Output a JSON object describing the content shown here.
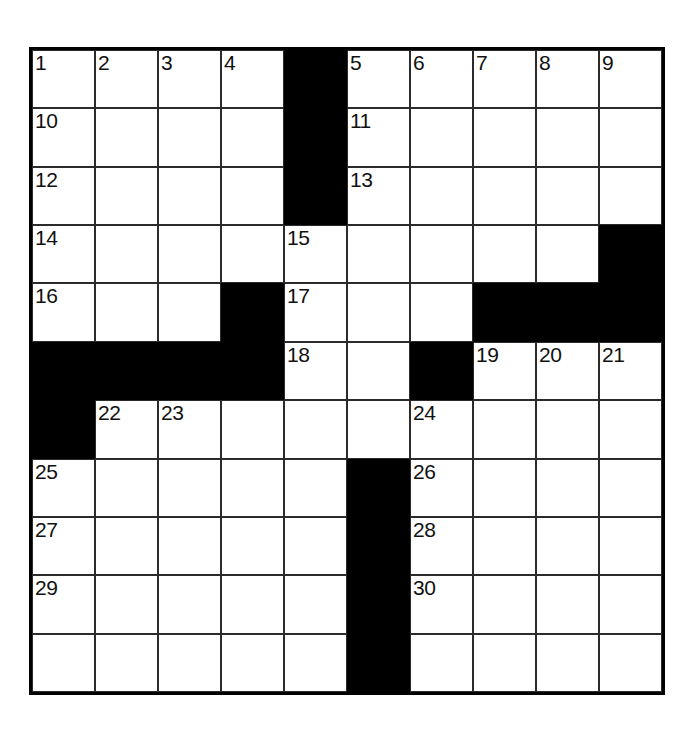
{
  "puzzle": {
    "kind": "crossword-grid",
    "columns": 10,
    "rows": 11,
    "colors": {
      "block": "#000000",
      "open": "#ffffff",
      "rule": "#2b2b2b",
      "border": "#000000",
      "number_text": "#111111"
    },
    "cells": [
      [
        {
          "r": 1,
          "c": 1,
          "block": false,
          "number": "1"
        },
        {
          "r": 1,
          "c": 2,
          "block": false,
          "number": "2"
        },
        {
          "r": 1,
          "c": 3,
          "block": false,
          "number": "3"
        },
        {
          "r": 1,
          "c": 4,
          "block": false,
          "number": "4"
        },
        {
          "r": 1,
          "c": 5,
          "block": true,
          "number": ""
        },
        {
          "r": 1,
          "c": 6,
          "block": false,
          "number": "5"
        },
        {
          "r": 1,
          "c": 7,
          "block": false,
          "number": "6"
        },
        {
          "r": 1,
          "c": 8,
          "block": false,
          "number": "7"
        },
        {
          "r": 1,
          "c": 9,
          "block": false,
          "number": "8"
        },
        {
          "r": 1,
          "c": 10,
          "block": false,
          "number": "9"
        }
      ],
      [
        {
          "r": 2,
          "c": 1,
          "block": false,
          "number": "10"
        },
        {
          "r": 2,
          "c": 2,
          "block": false,
          "number": ""
        },
        {
          "r": 2,
          "c": 3,
          "block": false,
          "number": ""
        },
        {
          "r": 2,
          "c": 4,
          "block": false,
          "number": ""
        },
        {
          "r": 2,
          "c": 5,
          "block": true,
          "number": ""
        },
        {
          "r": 2,
          "c": 6,
          "block": false,
          "number": "11"
        },
        {
          "r": 2,
          "c": 7,
          "block": false,
          "number": ""
        },
        {
          "r": 2,
          "c": 8,
          "block": false,
          "number": ""
        },
        {
          "r": 2,
          "c": 9,
          "block": false,
          "number": ""
        },
        {
          "r": 2,
          "c": 10,
          "block": false,
          "number": ""
        }
      ],
      [
        {
          "r": 3,
          "c": 1,
          "block": false,
          "number": "12"
        },
        {
          "r": 3,
          "c": 2,
          "block": false,
          "number": ""
        },
        {
          "r": 3,
          "c": 3,
          "block": false,
          "number": ""
        },
        {
          "r": 3,
          "c": 4,
          "block": false,
          "number": ""
        },
        {
          "r": 3,
          "c": 5,
          "block": true,
          "number": ""
        },
        {
          "r": 3,
          "c": 6,
          "block": false,
          "number": "13"
        },
        {
          "r": 3,
          "c": 7,
          "block": false,
          "number": ""
        },
        {
          "r": 3,
          "c": 8,
          "block": false,
          "number": ""
        },
        {
          "r": 3,
          "c": 9,
          "block": false,
          "number": ""
        },
        {
          "r": 3,
          "c": 10,
          "block": false,
          "number": ""
        }
      ],
      [
        {
          "r": 4,
          "c": 1,
          "block": false,
          "number": "14"
        },
        {
          "r": 4,
          "c": 2,
          "block": false,
          "number": ""
        },
        {
          "r": 4,
          "c": 3,
          "block": false,
          "number": ""
        },
        {
          "r": 4,
          "c": 4,
          "block": false,
          "number": ""
        },
        {
          "r": 4,
          "c": 5,
          "block": false,
          "number": "15"
        },
        {
          "r": 4,
          "c": 6,
          "block": false,
          "number": ""
        },
        {
          "r": 4,
          "c": 7,
          "block": false,
          "number": ""
        },
        {
          "r": 4,
          "c": 8,
          "block": false,
          "number": ""
        },
        {
          "r": 4,
          "c": 9,
          "block": false,
          "number": ""
        },
        {
          "r": 4,
          "c": 10,
          "block": true,
          "number": ""
        }
      ],
      [
        {
          "r": 5,
          "c": 1,
          "block": false,
          "number": "16"
        },
        {
          "r": 5,
          "c": 2,
          "block": false,
          "number": ""
        },
        {
          "r": 5,
          "c": 3,
          "block": false,
          "number": ""
        },
        {
          "r": 5,
          "c": 4,
          "block": true,
          "number": ""
        },
        {
          "r": 5,
          "c": 5,
          "block": false,
          "number": "17"
        },
        {
          "r": 5,
          "c": 6,
          "block": false,
          "number": ""
        },
        {
          "r": 5,
          "c": 7,
          "block": false,
          "number": ""
        },
        {
          "r": 5,
          "c": 8,
          "block": true,
          "number": ""
        },
        {
          "r": 5,
          "c": 9,
          "block": true,
          "number": ""
        },
        {
          "r": 5,
          "c": 10,
          "block": true,
          "number": ""
        }
      ],
      [
        {
          "r": 6,
          "c": 1,
          "block": true,
          "number": ""
        },
        {
          "r": 6,
          "c": 2,
          "block": true,
          "number": ""
        },
        {
          "r": 6,
          "c": 3,
          "block": true,
          "number": ""
        },
        {
          "r": 6,
          "c": 4,
          "block": true,
          "number": ""
        },
        {
          "r": 6,
          "c": 5,
          "block": false,
          "number": "18"
        },
        {
          "r": 6,
          "c": 6,
          "block": false,
          "number": ""
        },
        {
          "r": 6,
          "c": 7,
          "block": false,
          "number": ""
        },
        {
          "r": 6,
          "c": 8,
          "block": true,
          "number": ""
        },
        {
          "r": 6,
          "c": 9,
          "block": false,
          "number": "19"
        },
        {
          "r": 6,
          "c": 10,
          "block": false,
          "number": "20"
        }
      ],
      [
        {
          "r": 7,
          "c": 1,
          "block": true,
          "number": ""
        },
        {
          "r": 7,
          "c": 2,
          "block": false,
          "number": "22"
        },
        {
          "r": 7,
          "c": 3,
          "block": false,
          "number": "23"
        },
        {
          "r": 7,
          "c": 4,
          "block": false,
          "number": ""
        },
        {
          "r": 7,
          "c": 5,
          "block": false,
          "number": ""
        },
        {
          "r": 7,
          "c": 6,
          "block": false,
          "number": ""
        },
        {
          "r": 7,
          "c": 7,
          "block": false,
          "number": "24"
        },
        {
          "r": 7,
          "c": 8,
          "block": false,
          "number": ""
        },
        {
          "r": 7,
          "c": 9,
          "block": false,
          "number": ""
        },
        {
          "r": 7,
          "c": 10,
          "block": false,
          "number": ""
        }
      ],
      [
        {
          "r": 8,
          "c": 1,
          "block": false,
          "number": "25"
        },
        {
          "r": 8,
          "c": 2,
          "block": false,
          "number": ""
        },
        {
          "r": 8,
          "c": 3,
          "block": false,
          "number": ""
        },
        {
          "r": 8,
          "c": 4,
          "block": false,
          "number": ""
        },
        {
          "r": 8,
          "c": 5,
          "block": false,
          "number": ""
        },
        {
          "r": 8,
          "c": 6,
          "block": true,
          "number": ""
        },
        {
          "r": 8,
          "c": 7,
          "block": false,
          "number": "26"
        },
        {
          "r": 8,
          "c": 8,
          "block": false,
          "number": ""
        },
        {
          "r": 8,
          "c": 9,
          "block": false,
          "number": ""
        },
        {
          "r": 8,
          "c": 10,
          "block": false,
          "number": ""
        }
      ],
      [
        {
          "r": 9,
          "c": 1,
          "block": false,
          "number": "27"
        },
        {
          "r": 9,
          "c": 2,
          "block": false,
          "number": ""
        },
        {
          "r": 9,
          "c": 3,
          "block": false,
          "number": ""
        },
        {
          "r": 9,
          "c": 4,
          "block": false,
          "number": ""
        },
        {
          "r": 9,
          "c": 5,
          "block": false,
          "number": ""
        },
        {
          "r": 9,
          "c": 6,
          "block": true,
          "number": ""
        },
        {
          "r": 9,
          "c": 7,
          "block": false,
          "number": "28"
        },
        {
          "r": 9,
          "c": 8,
          "block": false,
          "number": ""
        },
        {
          "r": 9,
          "c": 9,
          "block": false,
          "number": ""
        },
        {
          "r": 9,
          "c": 10,
          "block": false,
          "number": ""
        }
      ],
      [
        {
          "r": 10,
          "c": 1,
          "block": false,
          "number": "29"
        },
        {
          "r": 10,
          "c": 2,
          "block": false,
          "number": ""
        },
        {
          "r": 10,
          "c": 3,
          "block": false,
          "number": ""
        },
        {
          "r": 10,
          "c": 4,
          "block": false,
          "number": ""
        },
        {
          "r": 10,
          "c": 5,
          "block": false,
          "number": ""
        },
        {
          "r": 10,
          "c": 6,
          "block": true,
          "number": ""
        },
        {
          "r": 10,
          "c": 7,
          "block": false,
          "number": "30"
        },
        {
          "r": 10,
          "c": 8,
          "block": false,
          "number": ""
        },
        {
          "r": 10,
          "c": 9,
          "block": false,
          "number": ""
        },
        {
          "r": 10,
          "c": 10,
          "block": false,
          "number": ""
        }
      ],
      [
        {
          "r": 11,
          "c": 1,
          "block": false,
          "number": ""
        },
        {
          "r": 11,
          "c": 2,
          "block": false,
          "number": ""
        },
        {
          "r": 11,
          "c": 3,
          "block": false,
          "number": ""
        },
        {
          "r": 11,
          "c": 4,
          "block": false,
          "number": ""
        },
        {
          "r": 11,
          "c": 5,
          "block": false,
          "number": ""
        },
        {
          "r": 11,
          "c": 6,
          "block": true,
          "number": ""
        },
        {
          "r": 11,
          "c": 7,
          "block": false,
          "number": ""
        },
        {
          "r": 11,
          "c": 8,
          "block": false,
          "number": ""
        },
        {
          "r": 11,
          "c": 9,
          "block": false,
          "number": ""
        },
        {
          "r": 11,
          "c": 10,
          "block": false,
          "number": ""
        }
      ]
    ],
    "overrides": {
      "note_row6": "row 6 has 19,20,21 at columns 8,9,10 with column 7 black",
      "row6_fix": [
        {
          "c": 7,
          "block": true,
          "number": ""
        },
        {
          "c": 8,
          "block": false,
          "number": "19"
        },
        {
          "c": 9,
          "block": false,
          "number": "20"
        },
        {
          "c": 10,
          "block": false,
          "number": "21"
        }
      ],
      "row5_fix": [
        {
          "c": 7,
          "block": false,
          "number": ""
        },
        {
          "c": 8,
          "block": true,
          "number": ""
        }
      ]
    }
  }
}
